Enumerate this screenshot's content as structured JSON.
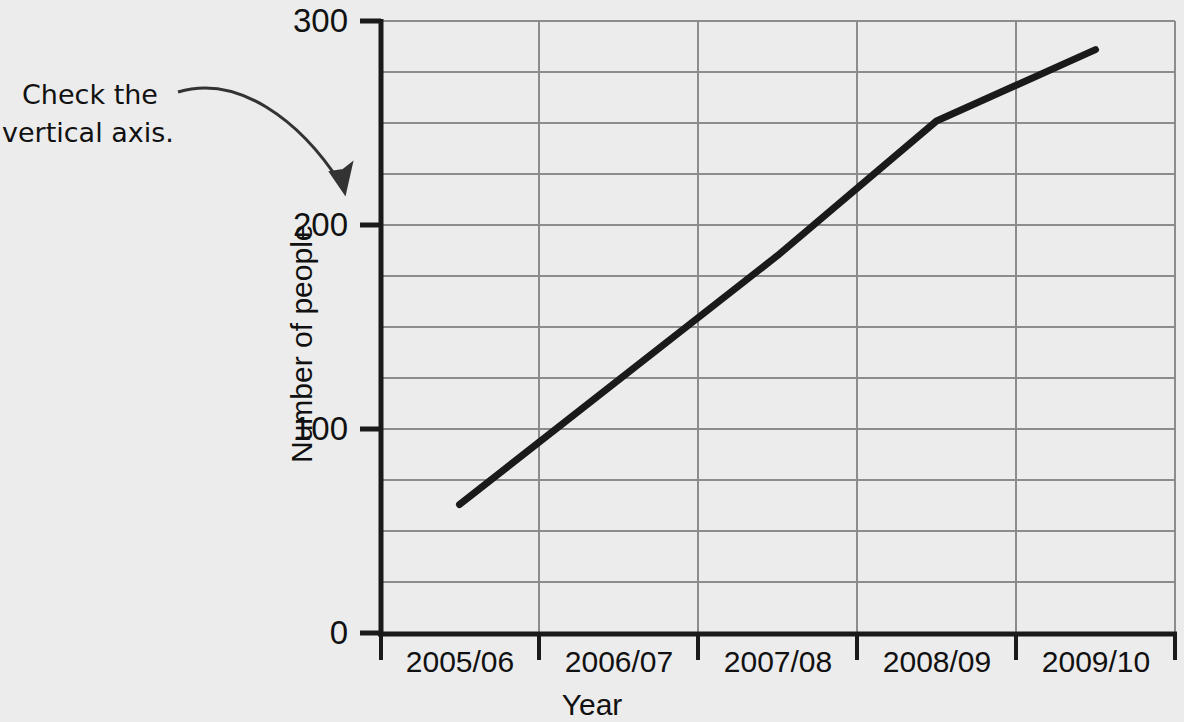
{
  "annotation": {
    "line1": "Check the",
    "line2": "vertical axis.",
    "arrow": "curved-arrow-to-y-axis"
  },
  "chart_data": {
    "type": "line",
    "title": "",
    "xlabel": "Year",
    "ylabel": "Number of people",
    "categories": [
      "2005/06",
      "2006/07",
      "2007/08",
      "2008/09",
      "2009/10"
    ],
    "values": [
      63,
      124,
      185,
      251,
      286
    ],
    "series": [
      {
        "name": "Number of people",
        "values": [
          63,
          124,
          185,
          251,
          286
        ]
      }
    ],
    "ylim": [
      0,
      300
    ],
    "ytick_labels": [
      "0",
      "100",
      "200",
      "300"
    ],
    "ytick_values": [
      0,
      100,
      200,
      300
    ],
    "yminor_step": 25,
    "grid": "both",
    "legend": "none",
    "line_color": "#1a1a1a",
    "grid_color": "#8c8c8c",
    "axis_color": "#1a1a1a",
    "background_color": "#ececec"
  }
}
